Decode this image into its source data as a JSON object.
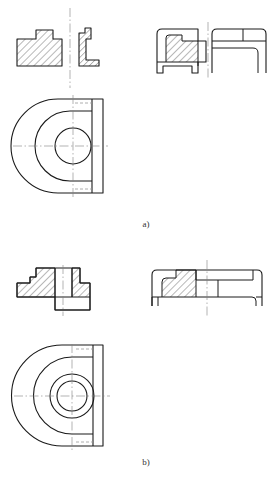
{
  "document": {
    "kind": "engineering-drawing",
    "description": "Two orthographic engineering drawings of a D-shaped bracket with a central bore, each shown as a sectional front elevation, a side/section elevation and a semicircular plan view.",
    "background_color": "#ffffff",
    "line_color": "#1a1a1a",
    "centerline_color": "#808080",
    "hidden_line_color": "#9a9a9a",
    "hatch_color": "#333333"
  },
  "figures": [
    {
      "id": "a",
      "label": "a)",
      "views": [
        {
          "name": "front-section-a",
          "type": "section",
          "hatched": true,
          "description": "Stepped hatched profile, full section, left of vertical centerline"
        },
        {
          "name": "side-section-a",
          "type": "section",
          "hatched": true,
          "description": "Small L-shaped hatched profile, right of vertical centerline"
        },
        {
          "name": "front-elevation-a",
          "type": "section",
          "hatched": true,
          "description": "Stepped hatched body with flange feet"
        },
        {
          "name": "side-elevation-a",
          "type": "outline",
          "hatched": false,
          "description": "Plain outline elevation with horizontal ledge lines"
        },
        {
          "name": "plan-view-a",
          "type": "plan",
          "hatched": false,
          "description": "Semicircular D-shaped plan with concentric arc, one central circular bore, straight right edge flange"
        }
      ],
      "circles": 1
    },
    {
      "id": "b",
      "label": "b)",
      "views": [
        {
          "name": "front-section-b",
          "type": "section",
          "hatched": true,
          "description": "Hatched stepped body with raised central boss and through bore"
        },
        {
          "name": "half-section-b",
          "type": "half-section",
          "hatched": true,
          "description": "Half section: hatched on left of centerline, plain outline on right"
        },
        {
          "name": "plan-view-b",
          "type": "plan",
          "hatched": false,
          "description": "Semicircular D-shaped plan with concentric arc and two concentric circles (boss and bore)"
        }
      ],
      "circles": 2
    }
  ]
}
